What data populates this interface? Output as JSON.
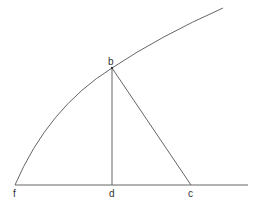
{
  "diagram": {
    "type": "geometry",
    "colors": {
      "stroke": "#666666",
      "label": "#333333",
      "background": "#ffffff"
    },
    "points": {
      "b": {
        "label": "b",
        "x": 112,
        "y": 68
      },
      "f": {
        "label": "f",
        "x": 15,
        "y": 185
      },
      "d": {
        "label": "d",
        "x": 112,
        "y": 185
      },
      "c": {
        "label": "c",
        "x": 191,
        "y": 185
      }
    },
    "labels": {
      "b": "b",
      "f": "f",
      "d": "d",
      "c": "c"
    },
    "elements": [
      {
        "kind": "curve",
        "from": "f",
        "through": "b",
        "to_end": [
          223,
          8
        ]
      },
      {
        "kind": "line",
        "from": "f",
        "to_end": [
          248,
          185
        ],
        "name": "baseline"
      },
      {
        "kind": "segment",
        "from": "b",
        "to": "d"
      },
      {
        "kind": "segment",
        "from": "b",
        "to": "c"
      }
    ]
  }
}
